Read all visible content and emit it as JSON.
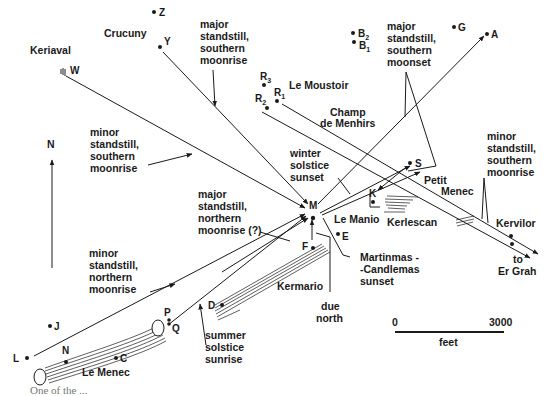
{
  "diagram": {
    "north_label": "N",
    "sites": {
      "keriaval": "Keriaval",
      "crucuny": "Crucuny",
      "le_moustoir": "Le Moustoir",
      "champ_de_menhirs_1": "Champ",
      "champ_de_menhirs_2": "de Menhirs",
      "petit_menec_1": "Petit",
      "petit_menec_2": "Menec",
      "le_manio": "Le Manio",
      "kerlescan": "Kerlescan",
      "kervilor": "Kervilor",
      "to_er_grah_1": "to",
      "to_er_grah_2": "Er Grah",
      "kermario": "Kermario",
      "le_menec": "Le Menec"
    },
    "points": {
      "Z": "Z",
      "Y": "Y",
      "W": "W",
      "R3": "R",
      "R3_sub": "3",
      "R2": "R",
      "R2_sub": "2",
      "R1": "R",
      "R1_sub": "1",
      "B2": "B",
      "B2_sub": "2",
      "B1": "B",
      "B1_sub": "1",
      "G": "G",
      "A": "A",
      "S": "S",
      "K": "K",
      "M": "M",
      "E": "E",
      "F": "F",
      "D": "D",
      "P": "P",
      "Q": "Q",
      "J": "J",
      "L": "L",
      "N": "N",
      "C": "C"
    },
    "annotations": {
      "major_southern_moonrise": [
        "major",
        "standstill,",
        "southern",
        "moonrise"
      ],
      "major_southern_moonset": [
        "major",
        "standstill,",
        "southern",
        "moonset"
      ],
      "minor_southern_moonrise_left": [
        "minor",
        "standstill,",
        "southern",
        "moonrise"
      ],
      "minor_southern_moonrise_right": [
        "minor",
        "standstill,",
        "southern",
        "moonrise"
      ],
      "winter_solstice_sunset": [
        "winter",
        "solstice",
        "sunset"
      ],
      "major_northern_moonrise": [
        "major",
        "standstill,",
        "northern",
        "moonrise (?)"
      ],
      "minor_northern_moonrise": [
        "minor",
        "standstill,",
        "northern",
        "moonrise"
      ],
      "martinmas_candlemas_sunset": [
        "Martinmas -",
        "-Candlemas",
        "sunset"
      ],
      "due_north": [
        "due",
        "north"
      ],
      "summer_solstice_sunrise": [
        "summer",
        "solstice",
        "sunrise"
      ]
    },
    "scale_bar": {
      "start": "0",
      "end": "3000",
      "unit": "feet"
    },
    "caption_fragment": "One of the ... "
  }
}
